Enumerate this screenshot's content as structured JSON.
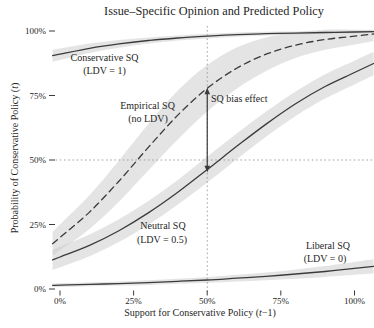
{
  "chart_data": {
    "type": "line",
    "title": "Issue–Specific Opinion and Predicted Policy",
    "xlabel": {
      "pre": "Support for Conservative Policy (",
      "var": "t",
      "post": "−1)"
    },
    "ylabel": {
      "pre": "Probability of Conservative Policy (",
      "var": "t",
      "post": ")"
    },
    "xlim": [
      0,
      100
    ],
    "ylim": [
      0,
      100
    ],
    "grid": "off",
    "legend": "inline-labels",
    "x_ticks": [
      "0%",
      "25%",
      "50%",
      "75%",
      "100%"
    ],
    "y_ticks": [
      "0%",
      "25%",
      "50%",
      "75%",
      "100%"
    ],
    "x": [
      0,
      10,
      20,
      30,
      40,
      50,
      60,
      70,
      80,
      90,
      100
    ],
    "series": [
      {
        "id": "conservative-sq",
        "label": "Conservative SQ",
        "sublabel": "(LDV = 1)",
        "line": "solid",
        "values": [
          91.0,
          93.3,
          95.0,
          96.3,
          97.3,
          98.0,
          98.6,
          99.0,
          99.2,
          99.4,
          99.6
        ],
        "ci": [
          2.2,
          1.8,
          1.5,
          1.2,
          1.0,
          0.9,
          0.8,
          0.7,
          0.6,
          0.5,
          0.5
        ]
      },
      {
        "id": "empirical-sq",
        "label": "Empirical SQ",
        "sublabel": "(no LDV)",
        "line": "dashed",
        "values": [
          20.0,
          29.8,
          41.8,
          54.9,
          67.4,
          77.8,
          85.6,
          91.0,
          94.5,
          96.7,
          98.0
        ],
        "ci": [
          5.0,
          6.5,
          8.0,
          9.0,
          9.5,
          9.0,
          8.0,
          6.5,
          5.0,
          4.0,
          3.2
        ]
      },
      {
        "id": "neutral-sq",
        "label": "Neutral SQ",
        "sublabel": "(LDV = 0.5)",
        "line": "solid",
        "values": [
          12.4,
          16.9,
          22.6,
          29.5,
          37.5,
          46.3,
          55.3,
          63.9,
          71.8,
          78.5,
          83.9
        ],
        "ci": [
          4.0,
          4.2,
          4.4,
          4.6,
          4.8,
          5.0,
          5.0,
          4.9,
          4.8,
          4.7,
          4.6
        ]
      },
      {
        "id": "liberal-sq",
        "label": "Liberal SQ",
        "sublabel": "(LDV = 0)",
        "line": "solid",
        "values": [
          1.5,
          1.8,
          2.1,
          2.5,
          3.0,
          3.5,
          4.2,
          4.9,
          5.8,
          6.8,
          8.0
        ],
        "ci": [
          0.7,
          0.7,
          0.8,
          0.9,
          1.0,
          1.1,
          1.3,
          1.5,
          1.8,
          2.1,
          2.5
        ]
      }
    ],
    "reference_lines": [
      {
        "axis": "x",
        "value": 50,
        "style": "dotted"
      },
      {
        "axis": "y",
        "value": 50,
        "style": "dotted"
      }
    ],
    "annotation": {
      "text": "SQ bias effect",
      "x": 50,
      "y_from": 78,
      "y_to": 45.3
    }
  },
  "colors": {
    "line": "#3b3b3b",
    "band": "#c9c9c9",
    "dotted": "#999999",
    "text": "#1f1f1f",
    "background": "#ffffff"
  }
}
